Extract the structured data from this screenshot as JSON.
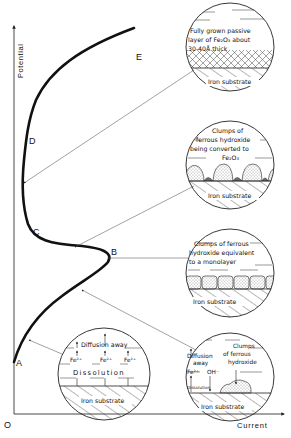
{
  "axes": {
    "y_label": "Potential",
    "x_label": "Current",
    "origin_label": "O"
  },
  "curve_points": {
    "A": "A",
    "B": "B",
    "C": "C",
    "D": "D",
    "E": "E"
  },
  "insets": [
    {
      "id": "passive-layer",
      "points_to": "D",
      "lines": [
        "Fully grown passive",
        "layer of Fe₂O₃ about",
        "30-40Å  thick"
      ],
      "substrate": "Iron substrate"
    },
    {
      "id": "converting-clumps",
      "points_to": "C-D",
      "lines": [
        "Clumps of",
        "ferrous hydroxide",
        "being converted to",
        "Fe₂O₃"
      ],
      "substrate": "Iron substrate"
    },
    {
      "id": "monolayer",
      "points_to": "B",
      "lines": [
        "Clumps of ferrous",
        "hydroxide equivalent",
        "to a  monolayer"
      ],
      "substrate": "Iron substrate"
    },
    {
      "id": "clumps-forming",
      "points_to": "A-B",
      "labels": {
        "diffusion": [
          "Diffusion",
          "away"
        ],
        "ion": "Fe²⁺",
        "hydroxide": "OH⁻",
        "clumps": [
          "Clumps",
          "of ferrous",
          "hydroxide"
        ],
        "dissolution": "Dissolution"
      },
      "substrate": "Iron substrate"
    },
    {
      "id": "dissolution",
      "points_to": "A",
      "labels": {
        "diffusion": "Diffusion away",
        "ions": [
          "Fe²⁺",
          "Fe²⁺",
          "Fe²⁺"
        ],
        "dissolution": "Dissolution"
      },
      "substrate": "Iron substrate"
    }
  ]
}
